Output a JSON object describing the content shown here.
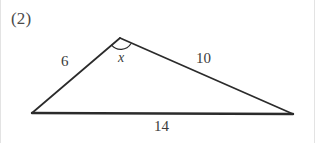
{
  "figure": {
    "problem_number": "(2)",
    "shape": "triangle",
    "stroke_color": "#2b2b2b",
    "text_color": "#3b3b3b",
    "background_color": "#ffffff",
    "vertices": {
      "left": {
        "x": 32,
        "y": 113
      },
      "apex": {
        "x": 120,
        "y": 38
      },
      "right": {
        "x": 293,
        "y": 114
      }
    },
    "sides": [
      {
        "name": "left-side",
        "label": "6",
        "from": "left",
        "to": "apex"
      },
      {
        "name": "right-side",
        "label": "10",
        "from": "apex",
        "to": "right"
      },
      {
        "name": "base",
        "label": "14",
        "from": "left",
        "to": "right"
      }
    ],
    "angles": [
      {
        "name": "apex-angle",
        "label": "x",
        "at": "apex",
        "marker": "arc"
      }
    ]
  },
  "labels": {
    "problem_number": "(2)",
    "side_a": "6",
    "side_b": "10",
    "side_c": "14",
    "angle_x": "x"
  }
}
